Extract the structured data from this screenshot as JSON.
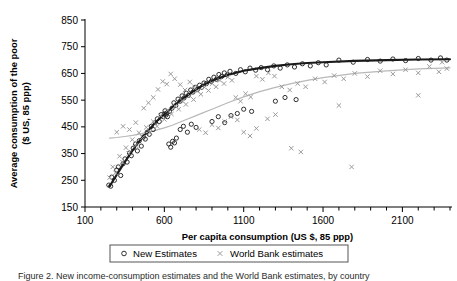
{
  "figure": {
    "caption": "Figure 2. New income-consumption estimates and the World Bank estimates, by country"
  },
  "legend": {
    "position": "bottom-center",
    "entries": [
      {
        "label": "New Estimates",
        "marker": "open-circle",
        "color": "#1a1a1a"
      },
      {
        "label": "World Bank estimates",
        "marker": "cross-x",
        "color": "#9a9a9a"
      }
    ]
  },
  "chart_data": {
    "type": "scatter",
    "title": "",
    "xlabel": "Per capita consumption (US $, 85 ppp)",
    "ylabel": "Average consumption of the poor ($ US, 85 ppp)",
    "xlim": [
      100,
      2400
    ],
    "ylim": [
      150,
      850
    ],
    "xticks": [
      100,
      600,
      1100,
      1600,
      2100
    ],
    "xticklabels": [
      "100",
      "600",
      "1100",
      "1600",
      "2100"
    ],
    "xminortick_step": 100,
    "yticks": [
      150,
      250,
      350,
      450,
      550,
      650,
      750,
      850
    ],
    "yticklabels": [
      "150",
      "250",
      "350",
      "450",
      "550",
      "650",
      "750",
      "850"
    ],
    "grid": false,
    "series": [
      {
        "name": "New Estimates",
        "marker": "open-circle",
        "color": "#1a1a1a",
        "points": [
          [
            250,
            232
          ],
          [
            262,
            228
          ],
          [
            268,
            262
          ],
          [
            285,
            250
          ],
          [
            300,
            288
          ],
          [
            310,
            300
          ],
          [
            325,
            268
          ],
          [
            340,
            312
          ],
          [
            352,
            330
          ],
          [
            365,
            318
          ],
          [
            380,
            352
          ],
          [
            392,
            342
          ],
          [
            404,
            370
          ],
          [
            418,
            386
          ],
          [
            430,
            360
          ],
          [
            442,
            398
          ],
          [
            455,
            378
          ],
          [
            468,
            412
          ],
          [
            480,
            404
          ],
          [
            492,
            430
          ],
          [
            505,
            422
          ],
          [
            518,
            452
          ],
          [
            530,
            440
          ],
          [
            542,
            466
          ],
          [
            556,
            480
          ],
          [
            568,
            470
          ],
          [
            580,
            496
          ],
          [
            592,
            488
          ],
          [
            604,
            510
          ],
          [
            616,
            502
          ],
          [
            628,
            386
          ],
          [
            640,
            374
          ],
          [
            652,
            396
          ],
          [
            664,
            390
          ],
          [
            676,
            408
          ],
          [
            600,
            498
          ],
          [
            610,
            494
          ],
          [
            620,
            488
          ],
          [
            632,
            508
          ],
          [
            648,
            520
          ],
          [
            660,
            540
          ],
          [
            672,
            530
          ],
          [
            686,
            554
          ],
          [
            700,
            546
          ],
          [
            712,
            566
          ],
          [
            724,
            558
          ],
          [
            738,
            576
          ],
          [
            752,
            568
          ],
          [
            766,
            588
          ],
          [
            780,
            580
          ],
          [
            794,
            598
          ],
          [
            808,
            590
          ],
          [
            822,
            606
          ],
          [
            836,
            598
          ],
          [
            850,
            614
          ],
          [
            700,
            440
          ],
          [
            720,
            452
          ],
          [
            745,
            430
          ],
          [
            770,
            460
          ],
          [
            800,
            448
          ],
          [
            865,
            612
          ],
          [
            880,
            628
          ],
          [
            896,
            620
          ],
          [
            912,
            636
          ],
          [
            928,
            628
          ],
          [
            944,
            646
          ],
          [
            960,
            638
          ],
          [
            978,
            652
          ],
          [
            996,
            644
          ],
          [
            1014,
            658
          ],
          [
            900,
            470
          ],
          [
            940,
            488
          ],
          [
            980,
            466
          ],
          [
            1020,
            492
          ],
          [
            1050,
            650
          ],
          [
            1080,
            664
          ],
          [
            1110,
            656
          ],
          [
            1140,
            670
          ],
          [
            1175,
            662
          ],
          [
            1060,
            500
          ],
          [
            1100,
            516
          ],
          [
            1150,
            508
          ],
          [
            1210,
            672
          ],
          [
            1250,
            664
          ],
          [
            1290,
            678
          ],
          [
            1330,
            670
          ],
          [
            1375,
            682
          ],
          [
            1420,
            674
          ],
          [
            1470,
            686
          ],
          [
            1520,
            678
          ],
          [
            1570,
            690
          ],
          [
            1620,
            682
          ],
          [
            1300,
            546
          ],
          [
            1360,
            560
          ],
          [
            1430,
            552
          ],
          [
            1700,
            700
          ],
          [
            1790,
            692
          ],
          [
            1880,
            702
          ],
          [
            1960,
            696
          ],
          [
            2040,
            704
          ],
          [
            2120,
            698
          ],
          [
            2200,
            706
          ],
          [
            2280,
            700
          ],
          [
            2340,
            708
          ],
          [
            2380,
            700
          ]
        ]
      },
      {
        "name": "World Bank estimates",
        "marker": "cross-x",
        "color": "#9a9a9a",
        "points": [
          [
            255,
            260
          ],
          [
            275,
            300
          ],
          [
            292,
            278
          ],
          [
            318,
            340
          ],
          [
            336,
            318
          ],
          [
            358,
            372
          ],
          [
            376,
            350
          ],
          [
            398,
            402
          ],
          [
            420,
            380
          ],
          [
            440,
            428
          ],
          [
            300,
            430
          ],
          [
            340,
            452
          ],
          [
            380,
            440
          ],
          [
            420,
            466
          ],
          [
            462,
            410
          ],
          [
            486,
            448
          ],
          [
            508,
            430
          ],
          [
            530,
            470
          ],
          [
            554,
            452
          ],
          [
            470,
            520
          ],
          [
            500,
            540
          ],
          [
            530,
            560
          ],
          [
            560,
            590
          ],
          [
            578,
            492
          ],
          [
            600,
            478
          ],
          [
            622,
            512
          ],
          [
            645,
            498
          ],
          [
            668,
            528
          ],
          [
            590,
            620
          ],
          [
            615,
            610
          ],
          [
            640,
            648
          ],
          [
            665,
            630
          ],
          [
            690,
            516
          ],
          [
            712,
            548
          ],
          [
            736,
            534
          ],
          [
            760,
            566
          ],
          [
            784,
            552
          ],
          [
            700,
            608
          ],
          [
            730,
            588
          ],
          [
            760,
            618
          ],
          [
            790,
            600
          ],
          [
            808,
            584
          ],
          [
            830,
            572
          ],
          [
            854,
            598
          ],
          [
            878,
            586
          ],
          [
            902,
            612
          ],
          [
            820,
            440
          ],
          [
            860,
            428
          ],
          [
            900,
            458
          ],
          [
            940,
            446
          ],
          [
            926,
            600
          ],
          [
            950,
            624
          ],
          [
            976,
            612
          ],
          [
            1000,
            636
          ],
          [
            1026,
            624
          ],
          [
            980,
            470
          ],
          [
            1020,
            488
          ],
          [
            1060,
            476
          ],
          [
            1050,
            560
          ],
          [
            1080,
            546
          ],
          [
            1112,
            574
          ],
          [
            1144,
            562
          ],
          [
            1100,
            430
          ],
          [
            1140,
            416
          ],
          [
            1180,
            444
          ],
          [
            1180,
            640
          ],
          [
            1218,
            628
          ],
          [
            1256,
            652
          ],
          [
            1294,
            640
          ],
          [
            1250,
            480
          ],
          [
            1300,
            496
          ],
          [
            1340,
            600
          ],
          [
            1390,
            588
          ],
          [
            1440,
            612
          ],
          [
            1490,
            600
          ],
          [
            1400,
            370
          ],
          [
            1460,
            356
          ],
          [
            1550,
            630
          ],
          [
            1610,
            618
          ],
          [
            1670,
            642
          ],
          [
            1730,
            630
          ],
          [
            1700,
            530
          ],
          [
            1780,
            300
          ],
          [
            1800,
            650
          ],
          [
            1880,
            638
          ],
          [
            1960,
            660
          ],
          [
            2040,
            648
          ],
          [
            2120,
            664
          ],
          [
            2200,
            652
          ],
          [
            2270,
            676
          ],
          [
            2330,
            656
          ],
          [
            2200,
            568
          ],
          [
            2350,
            692
          ],
          [
            2380,
            668
          ]
        ]
      }
    ],
    "fit_curves": [
      {
        "name": "New Estimates fit",
        "color": "#1a1a1a",
        "width": 2.1,
        "points": [
          [
            255,
            228
          ],
          [
            300,
            270
          ],
          [
            350,
            318
          ],
          [
            400,
            362
          ],
          [
            450,
            402
          ],
          [
            500,
            438
          ],
          [
            550,
            470
          ],
          [
            600,
            498
          ],
          [
            650,
            524
          ],
          [
            700,
            548
          ],
          [
            750,
            570
          ],
          [
            800,
            590
          ],
          [
            850,
            608
          ],
          [
            900,
            622
          ],
          [
            950,
            634
          ],
          [
            1000,
            644
          ],
          [
            1100,
            660
          ],
          [
            1200,
            670
          ],
          [
            1300,
            678
          ],
          [
            1400,
            684
          ],
          [
            1500,
            689
          ],
          [
            1600,
            692
          ],
          [
            1800,
            697
          ],
          [
            2000,
            700
          ],
          [
            2200,
            702
          ],
          [
            2400,
            703
          ]
        ]
      },
      {
        "name": "World Bank fit",
        "color": "#b8b8b8",
        "width": 1.2,
        "points": [
          [
            255,
            408
          ],
          [
            300,
            410
          ],
          [
            350,
            414
          ],
          [
            400,
            418
          ],
          [
            450,
            424
          ],
          [
            500,
            430
          ],
          [
            550,
            438
          ],
          [
            600,
            446
          ],
          [
            650,
            456
          ],
          [
            700,
            468
          ],
          [
            750,
            480
          ],
          [
            800,
            492
          ],
          [
            850,
            504
          ],
          [
            900,
            516
          ],
          [
            950,
            528
          ],
          [
            1000,
            540
          ],
          [
            1100,
            562
          ],
          [
            1200,
            582
          ],
          [
            1300,
            598
          ],
          [
            1400,
            612
          ],
          [
            1500,
            624
          ],
          [
            1600,
            634
          ],
          [
            1800,
            650
          ],
          [
            2000,
            660
          ],
          [
            2200,
            667
          ],
          [
            2400,
            671
          ]
        ]
      }
    ]
  }
}
